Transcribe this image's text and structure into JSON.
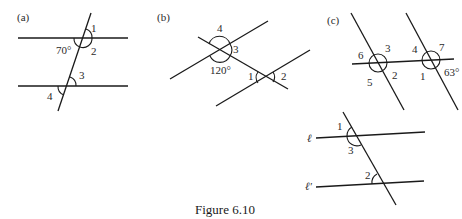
{
  "figure": {
    "caption": "Figure 6.10",
    "panels": {
      "a": {
        "label": "(a)",
        "angles": {
          "one": "1",
          "two": "2",
          "given": "70°",
          "three": "3",
          "four": "4"
        }
      },
      "b": {
        "label": "(b)",
        "angles": {
          "four": "4",
          "three": "3",
          "given": "120°",
          "one": "1",
          "two": "2"
        }
      },
      "c": {
        "label": "(c)",
        "angles": {
          "six": "6",
          "three": "3",
          "five": "5",
          "two": "2",
          "four": "4",
          "seven": "7",
          "one": "1",
          "given": "63°"
        }
      },
      "d": {
        "lines": {
          "l": "ℓ",
          "l_prime": "ℓ'"
        },
        "angles": {
          "one": "1",
          "three": "3",
          "two": "2"
        }
      }
    }
  }
}
